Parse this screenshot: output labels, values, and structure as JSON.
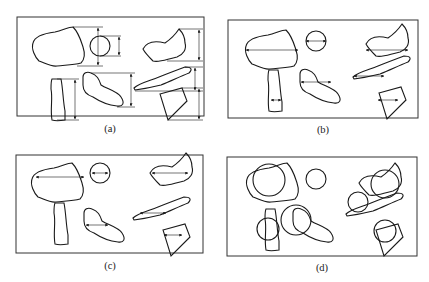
{
  "figure": {
    "panels": [
      {
        "id": "a",
        "label": "(a)",
        "description": "Feret (caliper) diameter measured vertically between parallel tangents",
        "x": 17,
        "y": 17,
        "w": 187,
        "h": 99,
        "label_x": 110,
        "label_y": 128
      },
      {
        "id": "b",
        "label": "(b)",
        "description": "Martin diameter: horizontal chord bisecting projected area",
        "x": 228,
        "y": 20,
        "w": 190,
        "h": 98,
        "label_x": 323,
        "label_y": 129
      },
      {
        "id": "c",
        "label": "(c)",
        "description": "Maximum horizontal chord length",
        "x": 16,
        "y": 155,
        "w": 187,
        "h": 98,
        "label_x": 110,
        "label_y": 265
      },
      {
        "id": "d",
        "label": "(d)",
        "description": "Projected area equivalent circle diameter",
        "x": 227,
        "y": 157,
        "w": 190,
        "h": 99,
        "label_x": 322,
        "label_y": 267
      }
    ],
    "colors": {
      "stroke": "#1a1a1a",
      "border": "#333333",
      "background": "#ffffff"
    }
  }
}
